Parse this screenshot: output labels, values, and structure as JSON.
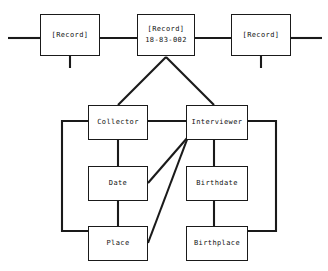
{
  "diagram": {
    "type": "record-attribute-node-link-diagram",
    "background_color": "#ffffff",
    "line_color": "#1a1a1a",
    "box_fill": "#ffffff",
    "spine": {
      "records": [
        {
          "id": "record-left",
          "label": "[Record]",
          "identifier": ""
        },
        {
          "id": "record-center",
          "label": "[Record]",
          "identifier": "18-83-002"
        },
        {
          "id": "record-right",
          "label": "[Record]",
          "identifier": ""
        }
      ]
    },
    "attributes": {
      "left_branch": [
        {
          "id": "collector",
          "label": "Collector"
        },
        {
          "id": "date",
          "label": "Date"
        },
        {
          "id": "place",
          "label": "Place"
        }
      ],
      "right_branch": [
        {
          "id": "interviewer",
          "label": "Interviewer"
        },
        {
          "id": "birthdate",
          "label": "Birthdate"
        },
        {
          "id": "birthplace",
          "label": "Birthplace"
        }
      ]
    }
  }
}
